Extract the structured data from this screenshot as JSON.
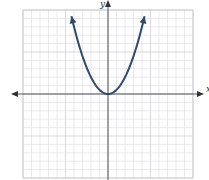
{
  "chart_data": {
    "type": "line",
    "title": "",
    "xlabel": "x",
    "ylabel": "y",
    "xlim": [
      -10,
      10
    ],
    "ylim": [
      -10,
      10
    ],
    "grid": true,
    "grid_minor_step": 1,
    "grid_major_step": 5,
    "legend": null,
    "series": [
      {
        "name": "parabola",
        "equation": "y = x^2 / 2",
        "vertex": [
          0,
          0
        ],
        "opens": "up",
        "arrows_on_ends": true,
        "x": [
          -4.3,
          -4,
          -3,
          -2,
          -1,
          0,
          1,
          2,
          3,
          4,
          4.3
        ],
        "y": [
          9.2,
          8,
          4.5,
          2,
          0.5,
          0,
          0.5,
          2,
          4.5,
          8,
          9.2
        ]
      }
    ]
  },
  "axes": {
    "x_label": "x",
    "y_label": "y"
  },
  "colors": {
    "curve": "#2f4a6a",
    "axis": "#555555",
    "grid_minor": "#e3e3e8",
    "grid_major": "#cfcfd6"
  }
}
